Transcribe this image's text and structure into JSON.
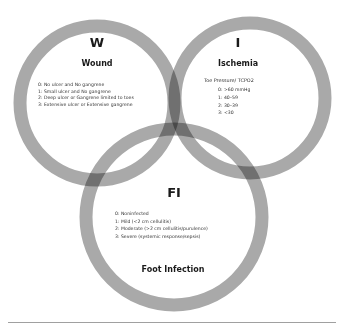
{
  "diagram": {
    "type": "venn",
    "colors": {
      "ring": "#a9a9a9",
      "overlap": "#707070",
      "text": "#1a1a1a",
      "rule": "#a0a0a0"
    },
    "circles": [
      {
        "id": "wound",
        "letter": "W",
        "title": "Wound",
        "items": [
          "0: No ulcer and No gangrene",
          "1: Small ulcer and No gangrene",
          "2: Deep ulcer or Gangrene limited to toes",
          "3: Extensive ulcer or Extensive gangrene"
        ]
      },
      {
        "id": "ischemia",
        "letter": "I",
        "title": "Ischemia",
        "subtitle": "Toe Pressure/ TCPO2",
        "items": [
          "0: >60 mmHg",
          "1: 40–59",
          "2: 30–39",
          "3: <30"
        ]
      },
      {
        "id": "foot-infection",
        "letter": "FI",
        "title": "Foot Infection",
        "items": [
          "0: Noninfected",
          "1: Mild (<2 cm cellulitis)",
          "2: Moderate (>2 cm cellulitis/purulence)",
          "3: Severe (systemic response/sepsis)"
        ]
      }
    ]
  }
}
